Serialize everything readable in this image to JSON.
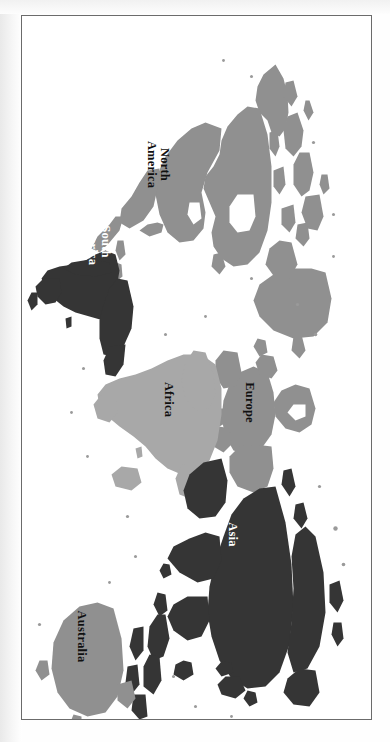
{
  "document": {
    "type": "map-figure",
    "title": "World Map",
    "orientation": "rotated-90-clockwise",
    "frame": {
      "border_color": "#6b6b6b",
      "background": "#ffffff"
    },
    "background": "#ffffff"
  },
  "legend": {
    "shades": [
      {
        "name": "dark-shade",
        "hex": "#353535",
        "continents": "Asia, South America"
      },
      {
        "name": "medium-shade",
        "hex": "#909090",
        "continents": "North America, Europe, Australia"
      },
      {
        "name": "light-shade",
        "hex": "#a8a8a8",
        "continents": "Africa"
      }
    ],
    "ocean": "#ffffff"
  },
  "map": {
    "type": "world-political-continents",
    "projection": "equirectangular",
    "continents": [
      {
        "id": "north-america",
        "label": "North\nAmerica",
        "label_lines": [
          "North",
          "America"
        ],
        "fill": "#909090",
        "text_color": "#101010",
        "label_x": 148,
        "label_y": 213,
        "font_size": 12.5
      },
      {
        "id": "south-america",
        "label": "South\nAmerica",
        "label_lines": [
          "South",
          "America"
        ],
        "fill": "#353535",
        "text_color": "#ffffff",
        "label_x": 225,
        "label_y": 272,
        "font_size": 12.5
      },
      {
        "id": "europe",
        "label": "Europe",
        "label_lines": [
          "Europe"
        ],
        "fill": "#909090",
        "text_color": "#101010",
        "label_x": 386,
        "label_y": 122,
        "font_size": 12.5
      },
      {
        "id": "africa",
        "label": "Africa",
        "label_lines": [
          "Africa"
        ],
        "fill": "#a8a8a8",
        "text_color": "#101010",
        "label_x": 383,
        "label_y": 203,
        "font_size": 12.5
      },
      {
        "id": "asia",
        "label": "Asia",
        "label_lines": [
          "Asia"
        ],
        "fill": "#353535",
        "text_color": "#ffffff",
        "label_x": 518,
        "label_y": 139,
        "font_size": 12.5
      },
      {
        "id": "australia",
        "label": "Australia",
        "label_lines": [
          "Australia"
        ],
        "fill": "#909090",
        "text_color": "#101010",
        "label_x": 620,
        "label_y": 290,
        "font_size": 12.5
      }
    ]
  }
}
